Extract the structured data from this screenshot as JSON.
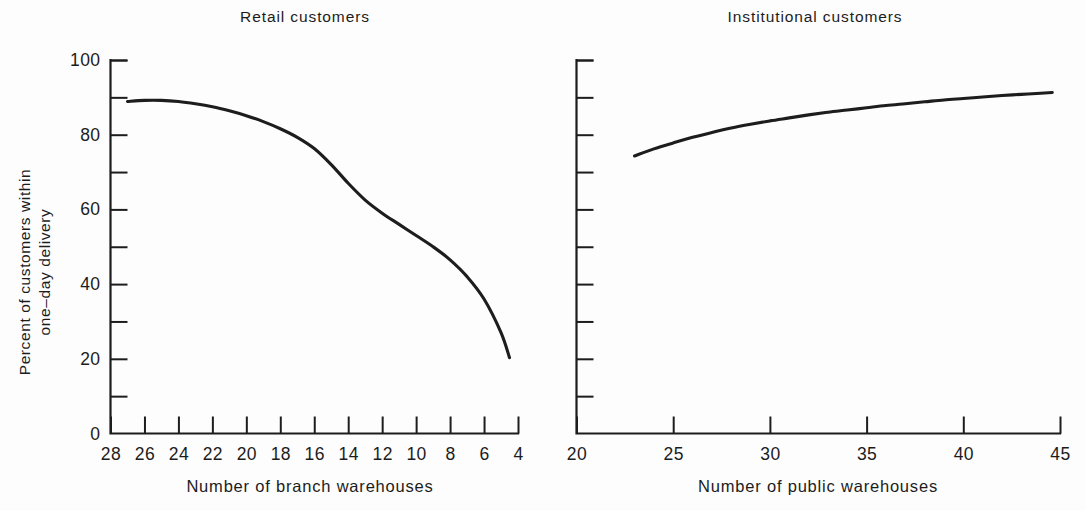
{
  "figure": {
    "background_color": "#fdfdfd",
    "ink_color": "#1d1d1d",
    "panel_count": 2
  },
  "chart_data": [
    {
      "type": "line",
      "panel": "left",
      "title": "Retail customers",
      "xlabel": "Number of branch warehouses",
      "ylabel": "Percent of customers within one–day delivery",
      "ylabel_line1": "Percent of customers within",
      "ylabel_line2": "one–day delivery",
      "xlim": [
        28,
        4
      ],
      "ylim": [
        0,
        100
      ],
      "x_axis_reversed": true,
      "grid": false,
      "legend": "none",
      "xticks": [
        28,
        26,
        24,
        22,
        20,
        18,
        16,
        14,
        12,
        10,
        8,
        6,
        4
      ],
      "xtick_labels": [
        "28",
        "26",
        "24",
        "22",
        "20",
        "18",
        "16",
        "14",
        "12",
        "10",
        "8",
        "6",
        "4"
      ],
      "yticks": [
        0,
        20,
        40,
        60,
        80,
        100
      ],
      "ytick_labels": [
        "0",
        "20",
        "40",
        "60",
        "80",
        "100"
      ],
      "yminor_ticks": [
        10,
        30,
        50,
        70,
        90
      ],
      "series": [
        {
          "name": "Retail customers",
          "x": [
            27.0,
            26.0,
            25.0,
            24.0,
            23.0,
            22.0,
            21.0,
            20.0,
            19.0,
            18.0,
            17.0,
            16.0,
            15.0,
            14.0,
            13.0,
            12.0,
            11.0,
            10.0,
            9.0,
            8.0,
            7.0,
            6.0,
            5.0,
            4.5
          ],
          "y": [
            88.9,
            89.2,
            89.2,
            88.9,
            88.3,
            87.5,
            86.4,
            85.1,
            83.5,
            81.6,
            79.3,
            76.3,
            72.0,
            67.0,
            62.5,
            59.0,
            56.0,
            53.0,
            50.0,
            46.5,
            42.0,
            36.0,
            27.0,
            20.3
          ]
        }
      ]
    },
    {
      "type": "line",
      "panel": "right",
      "title": "Institutional customers",
      "xlabel": "Number of public warehouses",
      "ylabel": "",
      "xlim": [
        20,
        45
      ],
      "ylim": [
        0,
        100
      ],
      "x_axis_reversed": false,
      "grid": false,
      "legend": "none",
      "xticks": [
        20,
        25,
        30,
        35,
        40,
        45
      ],
      "xtick_labels": [
        "20",
        "25",
        "30",
        "35",
        "40",
        "45"
      ],
      "yticks": [
        0,
        10,
        20,
        30,
        40,
        50,
        60,
        70,
        80,
        90,
        100
      ],
      "ytick_labels": [
        "",
        "",
        "",
        "",
        "",
        "",
        "",
        "",
        "",
        "",
        ""
      ],
      "y_axis_labeled": false,
      "series": [
        {
          "name": "Institutional customers",
          "x": [
            23.0,
            24.0,
            25.0,
            26.0,
            27.0,
            28.0,
            29.0,
            30.0,
            31.0,
            32.0,
            33.0,
            34.0,
            35.0,
            36.0,
            37.0,
            38.0,
            39.0,
            40.0,
            41.0,
            42.0,
            43.0,
            44.0,
            44.6
          ],
          "y": [
            74.3,
            76.2,
            77.8,
            79.3,
            80.6,
            81.8,
            82.8,
            83.7,
            84.5,
            85.3,
            86.0,
            86.6,
            87.2,
            87.8,
            88.3,
            88.8,
            89.3,
            89.7,
            90.1,
            90.5,
            90.8,
            91.1,
            91.3
          ]
        }
      ]
    }
  ]
}
